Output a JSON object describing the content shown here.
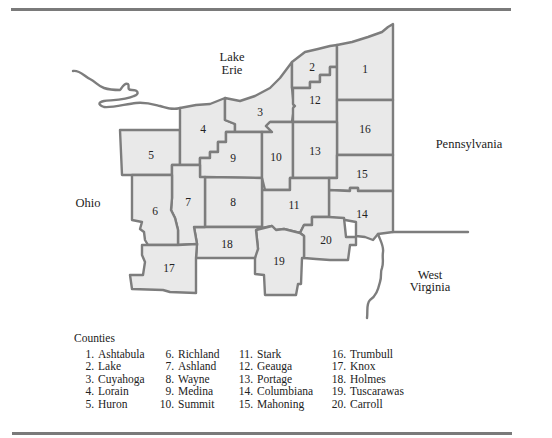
{
  "map": {
    "regions": {
      "lake": [
        "Lake",
        "Erie"
      ],
      "pennsylvania": "Pennsylvania",
      "ohio": "Ohio",
      "west_virginia": [
        "West",
        "Virginia"
      ]
    },
    "county_numbers": [
      "1",
      "2",
      "3",
      "4",
      "5",
      "6",
      "7",
      "8",
      "9",
      "10",
      "11",
      "12",
      "13",
      "14",
      "15",
      "16",
      "17",
      "18",
      "19",
      "20"
    ],
    "colors": {
      "county_fill": "#e9e9e9",
      "border": "#7d7d7d",
      "background": "#ffffff",
      "text": "#222222"
    }
  },
  "legend": {
    "title": "Counties",
    "items": [
      {
        "num": "1.",
        "name": "Ashtabula"
      },
      {
        "num": "2.",
        "name": "Lake"
      },
      {
        "num": "3.",
        "name": "Cuyahoga"
      },
      {
        "num": "4.",
        "name": "Lorain"
      },
      {
        "num": "5.",
        "name": "Huron"
      },
      {
        "num": "6.",
        "name": "Richland"
      },
      {
        "num": "7.",
        "name": "Ashland"
      },
      {
        "num": "8.",
        "name": "Wayne"
      },
      {
        "num": "9.",
        "name": "Medina"
      },
      {
        "num": "10.",
        "name": "Summit"
      },
      {
        "num": "11.",
        "name": "Stark"
      },
      {
        "num": "12.",
        "name": "Geauga"
      },
      {
        "num": "13.",
        "name": "Portage"
      },
      {
        "num": "14.",
        "name": "Columbiana"
      },
      {
        "num": "15.",
        "name": "Mahoning"
      },
      {
        "num": "16.",
        "name": "Trumbull"
      },
      {
        "num": "17.",
        "name": "Knox"
      },
      {
        "num": "18.",
        "name": "Holmes"
      },
      {
        "num": "19.",
        "name": "Tuscarawas"
      },
      {
        "num": "20.",
        "name": "Carroll"
      }
    ]
  }
}
